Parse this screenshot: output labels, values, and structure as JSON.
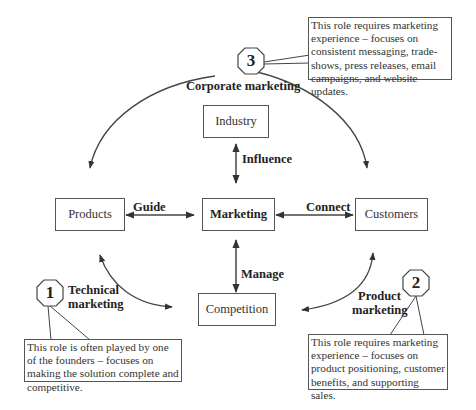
{
  "diagram": {
    "center": {
      "label": "Marketing"
    },
    "nodes": {
      "industry": "Industry",
      "products": "Products",
      "customers": "Customers",
      "competition": "Competition"
    },
    "relations": {
      "influence": "Influence",
      "guide": "Guide",
      "connect": "Connect",
      "manage": "Manage"
    },
    "roles": [
      {
        "number": "1",
        "title_line1": "Technical",
        "title_line2": "marketing",
        "note": "This role is often played by one of the founders – focuses on making the solution complete and competitive."
      },
      {
        "number": "2",
        "title_line1": "Product",
        "title_line2": "marketing",
        "note": "This role requires marketing experience – focuses on product positioning, customer benefits, and supporting sales."
      },
      {
        "number": "3",
        "title": "Corporate marketing",
        "note": "This role requires marketing experience – focuses on consistent messaging, trade-shows, press releases, email campaigns, and website updates."
      }
    ],
    "colors": {
      "line": "#444444",
      "border": "#555555",
      "text": "#222222"
    }
  }
}
